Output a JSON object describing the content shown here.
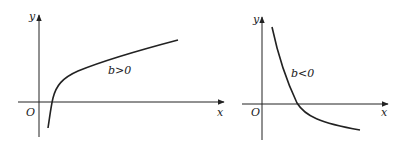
{
  "figures": [
    {
      "id": "left",
      "axis_labels": {
        "y": "y",
        "x": "x",
        "origin": "O"
      },
      "curve_label": "b>0",
      "description": "increasing logarithmic-type curve"
    },
    {
      "id": "right",
      "axis_labels": {
        "y": "y",
        "x": "x",
        "origin": "O"
      },
      "curve_label": "b<0",
      "description": "decreasing curve"
    }
  ],
  "colors": {
    "stroke": "#222222",
    "background": "#ffffff"
  }
}
